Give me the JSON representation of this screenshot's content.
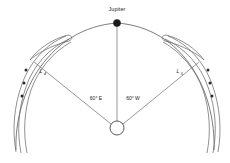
{
  "figure": {
    "background_color": "#ffffff",
    "line_color": "#6b6b6b",
    "marker_color": "#1a1a1a"
  },
  "bodies": {
    "planet": {
      "name": "Jupiter",
      "label": "Jupiter",
      "marker": "filled-circle",
      "x": 117,
      "y": 23
    },
    "sun": {
      "name": "Sun",
      "label": "",
      "marker": "open-circle",
      "x": 117,
      "y": 128,
      "radius": 7
    }
  },
  "lagrange_points": [
    {
      "id": "L4",
      "label": "L",
      "subscript": "4",
      "side": "leading-east",
      "angle_label": "60° E",
      "label_x": 41,
      "label_y": 72
    },
    {
      "id": "L5",
      "label": "L",
      "subscript": "5",
      "side": "trailing-west",
      "angle_label": "60° W",
      "label_x": 178,
      "label_y": 72
    }
  ],
  "angles": {
    "east": "60° E",
    "west": "60° W",
    "east_x": 96,
    "east_y": 99,
    "west_x": 131,
    "west_y": 99
  },
  "orbit": {
    "name": "jupiter-orbit",
    "style": "arc",
    "stroke": "#5a5a5a"
  },
  "swarms": {
    "count": 2,
    "arcs_per_swarm": 3,
    "asteroid_markers_per_swarm": 3
  }
}
